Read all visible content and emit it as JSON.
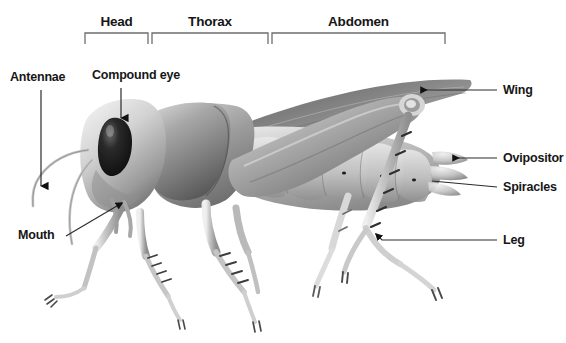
{
  "figure": {
    "background_color": "#ffffff",
    "label_color": "#161616",
    "line_color": "#3a3a3a",
    "bracket_color": "#6e6e6e"
  },
  "region_brackets": [
    {
      "label": "Head",
      "x1": 85,
      "x2": 148,
      "label_x": 116,
      "label_y": 22
    },
    {
      "label": "Thorax",
      "x1": 152,
      "x2": 268,
      "label_x": 205,
      "label_y": 22
    },
    {
      "label": "Abdomen",
      "x1": 272,
      "x2": 445,
      "label_x": 356,
      "label_y": 22
    }
  ],
  "callouts": [
    {
      "name": "antennae",
      "label": "Antennae",
      "label_x": 10,
      "label_y": 78,
      "anchor": "left",
      "arrow": "down"
    },
    {
      "name": "compound-eye",
      "label": "Compound eye",
      "label_x": 92,
      "label_y": 76,
      "anchor": "left",
      "arrow": "down"
    },
    {
      "name": "mouth",
      "label": "Mouth",
      "label_x": 18,
      "label_y": 234,
      "anchor": "left",
      "arrow": "diagonal-up-right"
    },
    {
      "name": "wing",
      "label": "Wing",
      "label_x": 503,
      "label_y": 94,
      "anchor": "right",
      "arrow": "left"
    },
    {
      "name": "ovipositor",
      "label": "Ovipositor",
      "label_x": 503,
      "label_y": 157,
      "anchor": "right",
      "arrow": "left"
    },
    {
      "name": "spiracles",
      "label": "Spiracles",
      "label_x": 503,
      "label_y": 186,
      "anchor": "right",
      "arrow": "none"
    },
    {
      "name": "leg",
      "label": "Leg",
      "label_x": 503,
      "label_y": 240,
      "anchor": "right",
      "arrow": "left"
    }
  ]
}
